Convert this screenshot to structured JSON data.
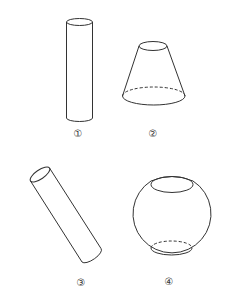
{
  "figure": {
    "stroke_color": "#333333",
    "background": "#ffffff",
    "shapes": [
      {
        "id": 1,
        "label": "①",
        "type": "cylinder-vertical"
      },
      {
        "id": 2,
        "label": "②",
        "type": "frustum-of-cone"
      },
      {
        "id": 3,
        "label": "③",
        "type": "cylinder-tilted"
      },
      {
        "id": 4,
        "label": "④",
        "type": "sphere-with-two-parallel-cuts"
      }
    ]
  }
}
